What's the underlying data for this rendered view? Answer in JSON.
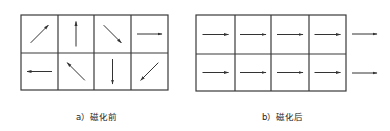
{
  "figure": {
    "colors": {
      "line": "#3a3a3a",
      "arrow": "#333333",
      "background": "#ffffff"
    },
    "panel_a": {
      "caption": "a）磁化前",
      "rows": 2,
      "cols": 4,
      "domains": [
        [
          "up-right",
          "up",
          "down-right",
          "right"
        ],
        [
          "left",
          "up-left",
          "down",
          "down-left"
        ]
      ]
    },
    "panel_b": {
      "caption": "b）磁化后",
      "rows": 2,
      "cols": 4,
      "domains": [
        [
          "right",
          "right",
          "right",
          "right"
        ],
        [
          "right",
          "right",
          "right",
          "right"
        ]
      ],
      "extra_arrows_outside": [
        "right",
        "right"
      ]
    }
  }
}
